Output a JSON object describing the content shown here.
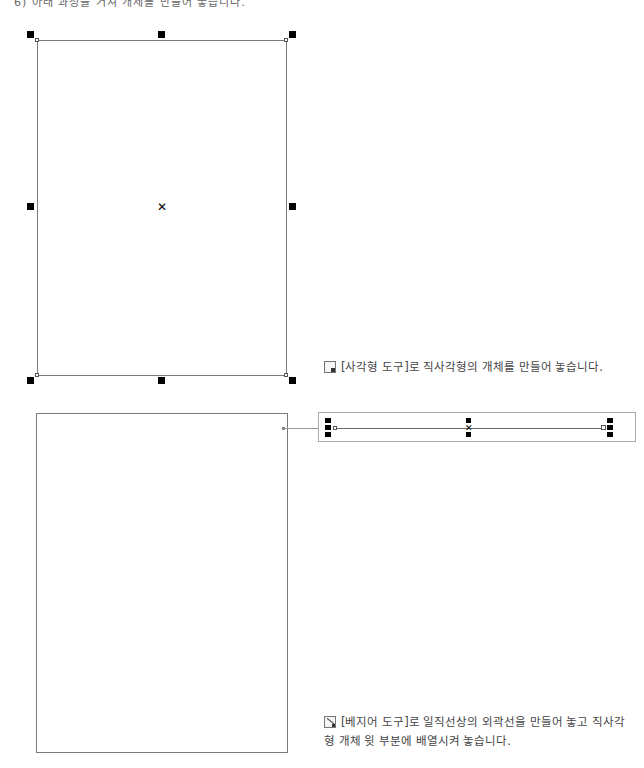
{
  "header": {
    "cropped_text": "6) 아래 과정을 거쳐 개체를 만들어 놓습니다."
  },
  "step1": {
    "caption": "[사각형 도구]로 직사각형의 개체를 만들어 놓습니다.",
    "icon": "rectangle-tool-icon"
  },
  "step2": {
    "caption": "[베지어 도구]로 일직선상의 외곽선을 만들어 놓고 직사각형 개체 윗 부분에 배열시켜 놓습니다.",
    "icon": "bezier-tool-icon"
  },
  "colors": {
    "outline": "#7a7a7a",
    "handle": "#000000",
    "text": "#444444"
  }
}
